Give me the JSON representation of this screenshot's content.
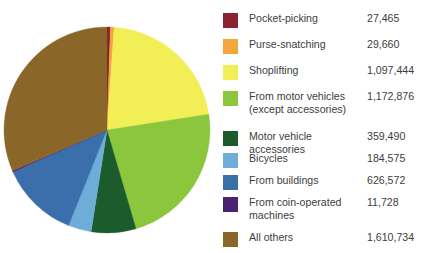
{
  "chart_data": {
    "type": "pie",
    "title": "",
    "subtitle": "",
    "xlabel": "",
    "ylabel": "",
    "legend_position": "right",
    "grid": false,
    "start_angle_deg": 0,
    "direction": "clockwise",
    "total": 5120546,
    "categories": [
      "Pocket-picking",
      "Purse-snatching",
      "Shoplifting",
      "From motor vehicles (except accessories)",
      "Motor vehicle accessories",
      "Bicycles",
      "From buildings",
      "From coin-operated machines",
      "All others"
    ],
    "values": [
      27465,
      29660,
      1097444,
      1172876,
      359490,
      184575,
      626572,
      11728,
      1610734
    ],
    "colors": [
      "#8c2230",
      "#f2a73c",
      "#f2ee55",
      "#8cc63c",
      "#1c5c2c",
      "#6fadd9",
      "#3b6fab",
      "#4b2270",
      "#8a6628"
    ],
    "value_labels": [
      "27,465",
      "29,660",
      "1,097,444",
      "1,172,876",
      "359,490",
      "184,575",
      "626,572",
      "11,728",
      "1,610,734"
    ]
  },
  "pie": {
    "center_x": 107,
    "center_y": 130,
    "radius": 103
  },
  "legend": {
    "rows": [
      {
        "label": "Pocket-picking",
        "value": "27,465",
        "color": "#8c2230",
        "y": 7,
        "lines": 1
      },
      {
        "label": "Purse-snatching",
        "value": "29,660",
        "color": "#f2a73c",
        "y": 33,
        "lines": 1
      },
      {
        "label": "Shoplifting",
        "value": "1,097,444",
        "color": "#f2ee55",
        "y": 59,
        "lines": 1
      },
      {
        "label": "From motor vehicles\n(except accessories)",
        "value": "1,172,876",
        "color": "#8cc63c",
        "y": 85,
        "lines": 2
      },
      {
        "label": "Motor vehicle accessories",
        "value": "359,490",
        "color": "#1c5c2c",
        "y": 125,
        "lines": 1
      },
      {
        "label": "Bicycles",
        "value": "184,575",
        "color": "#6fadd9",
        "y": 147,
        "lines": 1
      },
      {
        "label": "From buildings",
        "value": "626,572",
        "color": "#3b6fab",
        "y": 169,
        "lines": 1
      },
      {
        "label": "From coin-operated\nmachines",
        "value": "11,728",
        "color": "#4b2270",
        "y": 191,
        "lines": 2
      },
      {
        "label": "All others",
        "value": "1,610,734",
        "color": "#8a6628",
        "y": 226,
        "lines": 1
      }
    ]
  }
}
